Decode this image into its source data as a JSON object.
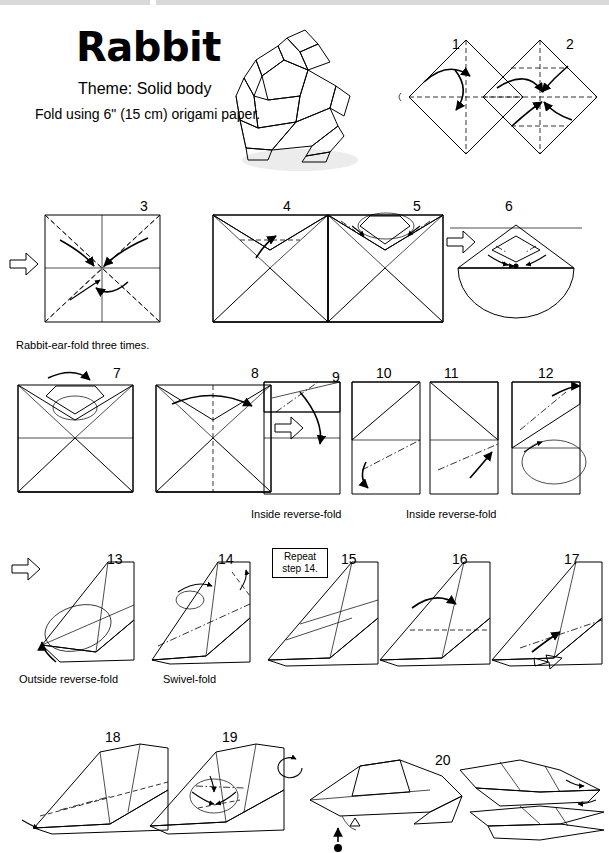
{
  "header": {
    "title": "Rabbit",
    "theme": "Theme: Solid body",
    "fold_note": "Fold using 6\" (15 cm) origami paper."
  },
  "steps": [
    {
      "num": "1"
    },
    {
      "num": "2"
    },
    {
      "num": "3"
    },
    {
      "num": "4"
    },
    {
      "num": "5"
    },
    {
      "num": "6"
    },
    {
      "num": "7"
    },
    {
      "num": "8"
    },
    {
      "num": "9"
    },
    {
      "num": "10"
    },
    {
      "num": "11"
    },
    {
      "num": "12"
    },
    {
      "num": "13"
    },
    {
      "num": "14"
    },
    {
      "num": "15"
    },
    {
      "num": "16"
    },
    {
      "num": "17"
    },
    {
      "num": "18"
    },
    {
      "num": "19"
    },
    {
      "num": "20"
    }
  ],
  "captions": {
    "rabbit_ear": "Rabbit-ear-fold three times.",
    "inside_reverse_1": "Inside reverse-fold",
    "inside_reverse_2": "Inside reverse-fold",
    "outside_reverse": "Outside reverse-fold",
    "swivel": "Swivel-fold",
    "repeat_box": "Repeat step 14."
  },
  "colors": {
    "paper_front": "#a8a8a8",
    "paper_back": "#ffffff",
    "line": "#000000",
    "shadow": "#ececec"
  }
}
